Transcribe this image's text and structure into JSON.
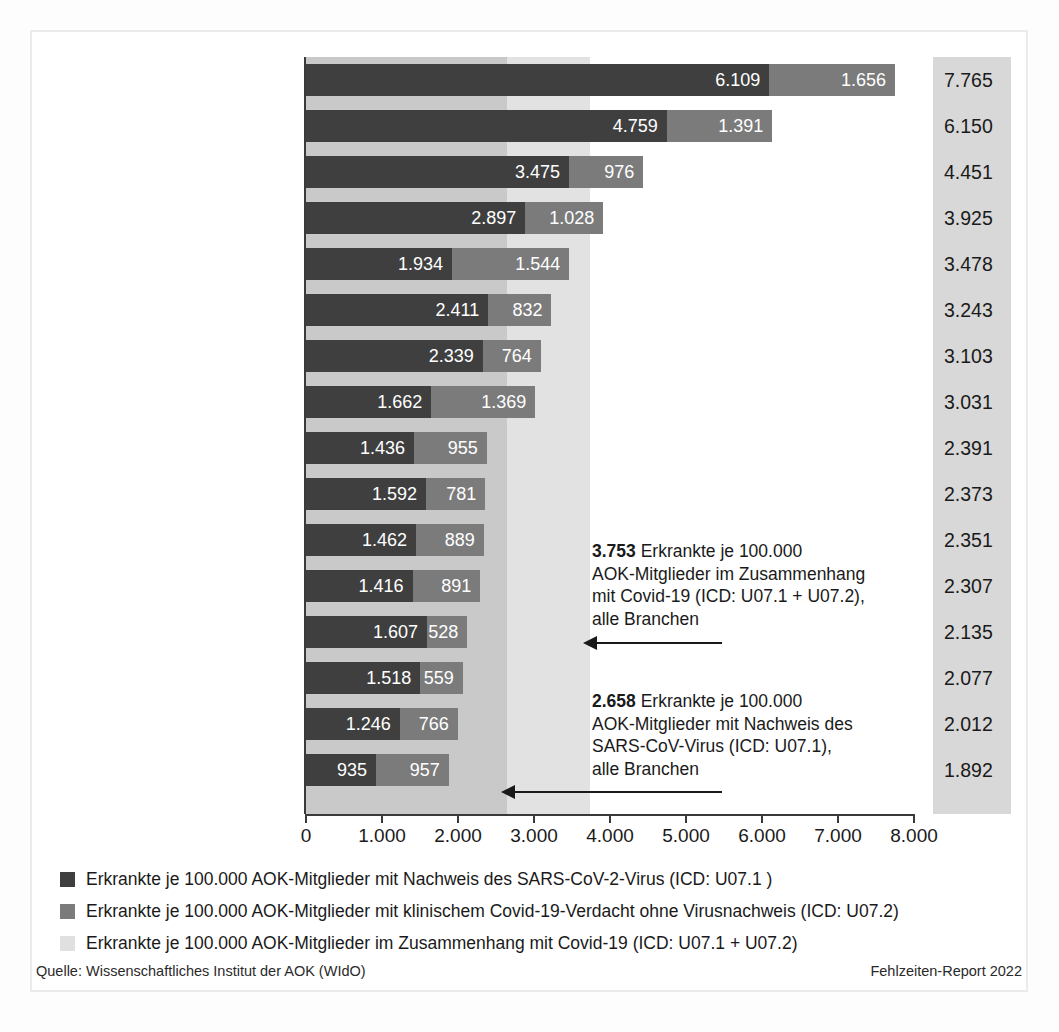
{
  "chart_data": {
    "type": "bar",
    "subtype": "stacked-horizontal",
    "title": "",
    "xlabel": "",
    "ylabel": "",
    "xlim": [
      0,
      8000
    ],
    "xticks": [
      0,
      1000,
      2000,
      3000,
      4000,
      5000,
      6000,
      7000,
      8000
    ],
    "xtick_labels": [
      "0",
      "1.000",
      "2.000",
      "3.000",
      "4.000",
      "5.000",
      "6.000",
      "7.000",
      "8.000"
    ],
    "grid": false,
    "legend_position": "bottom",
    "categories": [
      "Sachsen",
      "Thüringen",
      "Bayern",
      "Baden-Württemberg",
      "Hessen",
      "Brandenburg",
      "Sachsen-Anhalt",
      "Niedersachsen",
      "Nordrhein-Westfalen",
      "Mecklenburg-Vorpommern",
      "Rheinland-Pfalz",
      "Bremen",
      "Berlin",
      "Saarland",
      "Hamburg",
      "Schleswig-Holstein"
    ],
    "series": [
      {
        "name": "Erkrankte je 100.000 AOK-Mitglieder mit Nachweis des SARS-CoV-2-Virus (ICD: U07.1 )",
        "color": "#3f3f3f",
        "values": [
          6109,
          4759,
          3475,
          2897,
          1934,
          2411,
          2339,
          1662,
          1436,
          1592,
          1462,
          1416,
          1607,
          1518,
          1246,
          935
        ],
        "labels": [
          "6.109",
          "4.759",
          "3.475",
          "2.897",
          "1.934",
          "2.411",
          "2.339",
          "1.662",
          "1.436",
          "1.592",
          "1.462",
          "1.416",
          "1.607",
          "1.518",
          "1.246",
          "935"
        ]
      },
      {
        "name": "Erkrankte je 100.000 AOK-Mitglieder mit klinischem Covid-19-Verdacht ohne Virusnachweis (ICD: U07.2)",
        "color": "#7b7b7b",
        "values": [
          1656,
          1391,
          976,
          1028,
          1544,
          832,
          764,
          1369,
          955,
          781,
          889,
          891,
          528,
          559,
          766,
          957
        ],
        "labels": [
          "1.656",
          "1.391",
          "976",
          "1.028",
          "1.544",
          "832",
          "764",
          "1.369",
          "955",
          "781",
          "889",
          "891",
          "528",
          "559",
          "766",
          "957"
        ]
      }
    ],
    "totals": {
      "name": "Erkrankte je 100.000 AOK-Mitglieder im Zusammenhang mit Covid-19 (ICD: U07.1 + U07.2)",
      "values": [
        7765,
        6150,
        4451,
        3925,
        3478,
        3243,
        3103,
        3031,
        2391,
        2373,
        2351,
        2307,
        2135,
        2077,
        2012,
        1892
      ],
      "labels": [
        "7.765",
        "6.150",
        "4.451",
        "3.925",
        "3.478",
        "3.243",
        "3.103",
        "3.031",
        "2.391",
        "2.373",
        "2.351",
        "2.307",
        "2.135",
        "2.077",
        "2.012",
        "1.892"
      ]
    },
    "reference_bands": [
      {
        "name": "Nachweis SARS-CoV-Virus (U07.1), alle Branchen",
        "value": 2658,
        "label": "2.658",
        "color": "#c9c9c9"
      },
      {
        "name": "im Zusammenhang mit Covid-19 (U07.1 + U07.2), alle Branchen",
        "value": 3753,
        "label": "3.753",
        "color": "#e2e2e2"
      }
    ],
    "annotations": [
      {
        "value_label": "3.753",
        "text": " Erkrankte je 100.000 AOK-Mitglieder im Zusammenhang mit Covid-19 (ICD: U07.1 + U07.2), alle Branchen",
        "lines": [
          "3.753 Erkrankte je 100.000",
          "AOK-Mitglieder im Zusammenhang",
          "mit Covid-19 (ICD: U07.1 + U07.2),",
          "alle Branchen"
        ]
      },
      {
        "value_label": "2.658",
        "text": " Erkrankte je 100.000 AOK-Mitglieder mit Nachweis des SARS-CoV-Virus (ICD: U07.1), alle Branchen",
        "lines": [
          "2.658 Erkrankte je 100.000",
          "AOK-Mitglieder mit Nachweis des",
          "SARS-CoV-Virus (ICD: U07.1),",
          "alle Branchen"
        ]
      }
    ]
  },
  "annotation1": {
    "value": "3.753",
    "rest": " Erkrankte je 100.000",
    "line2": "AOK-Mitglieder im Zusammenhang",
    "line3": "mit Covid-19 (ICD: U07.1 + U07.2),",
    "line4": "alle Branchen"
  },
  "annotation2": {
    "value": "2.658",
    "rest": " Erkrankte je 100.000",
    "line2": "AOK-Mitglieder mit Nachweis des",
    "line3": "SARS-CoV-Virus (ICD: U07.1),",
    "line4": "alle Branchen"
  },
  "legend": {
    "items": [
      {
        "label": "Erkrankte je 100.000 AOK-Mitglieder mit Nachweis des SARS-CoV-2-Virus (ICD: U07.1 )",
        "color": "#3f3f3f"
      },
      {
        "label": "Erkrankte je 100.000 AOK-Mitglieder mit klinischem Covid-19-Verdacht ohne Virusnachweis (ICD: U07.2)",
        "color": "#7b7b7b"
      },
      {
        "label": "Erkrankte je 100.000 AOK-Mitglieder im Zusammenhang mit Covid-19 (ICD: U07.1 + U07.2)",
        "color": "#e0e0e0"
      }
    ]
  },
  "footer": {
    "source": "Quelle: Wissenschaftliches Institut der AOK (WIdO)",
    "report": "Fehlzeiten-Report 2022"
  }
}
